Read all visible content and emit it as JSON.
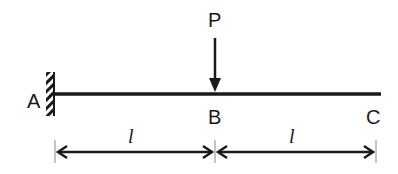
{
  "diagram": {
    "type": "cantilever-beam",
    "labels": {
      "fixed_end": "A",
      "load_point": "B",
      "free_end": "C",
      "load": "P"
    },
    "dimensions": [
      {
        "from": "A",
        "to": "B",
        "label": "l"
      },
      {
        "from": "B",
        "to": "C",
        "label": "l"
      }
    ],
    "colors": {
      "line": "#1a1a1a",
      "background": "#ffffff"
    }
  }
}
